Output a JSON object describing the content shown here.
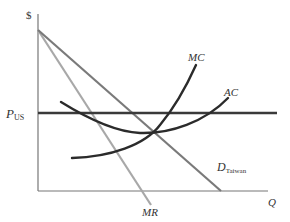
{
  "diagram": {
    "title": "",
    "type": "economics-monopoly-cost-revenue",
    "axes": {
      "y_label": "$",
      "x_label": "Q"
    },
    "labels": {
      "price_line": "P",
      "price_line_sub": "US",
      "marginal_cost": "MC",
      "average_cost": "AC",
      "demand": "D",
      "demand_sub": "Taiwan",
      "marginal_revenue": "MR"
    },
    "colors": {
      "axis": "#777777",
      "price_line": "#3a3a3a",
      "demand": "#7a7a7a",
      "marginal_revenue": "#a8a8a8",
      "cost_curves": "#2b2b2b",
      "text": "#333333"
    }
  }
}
